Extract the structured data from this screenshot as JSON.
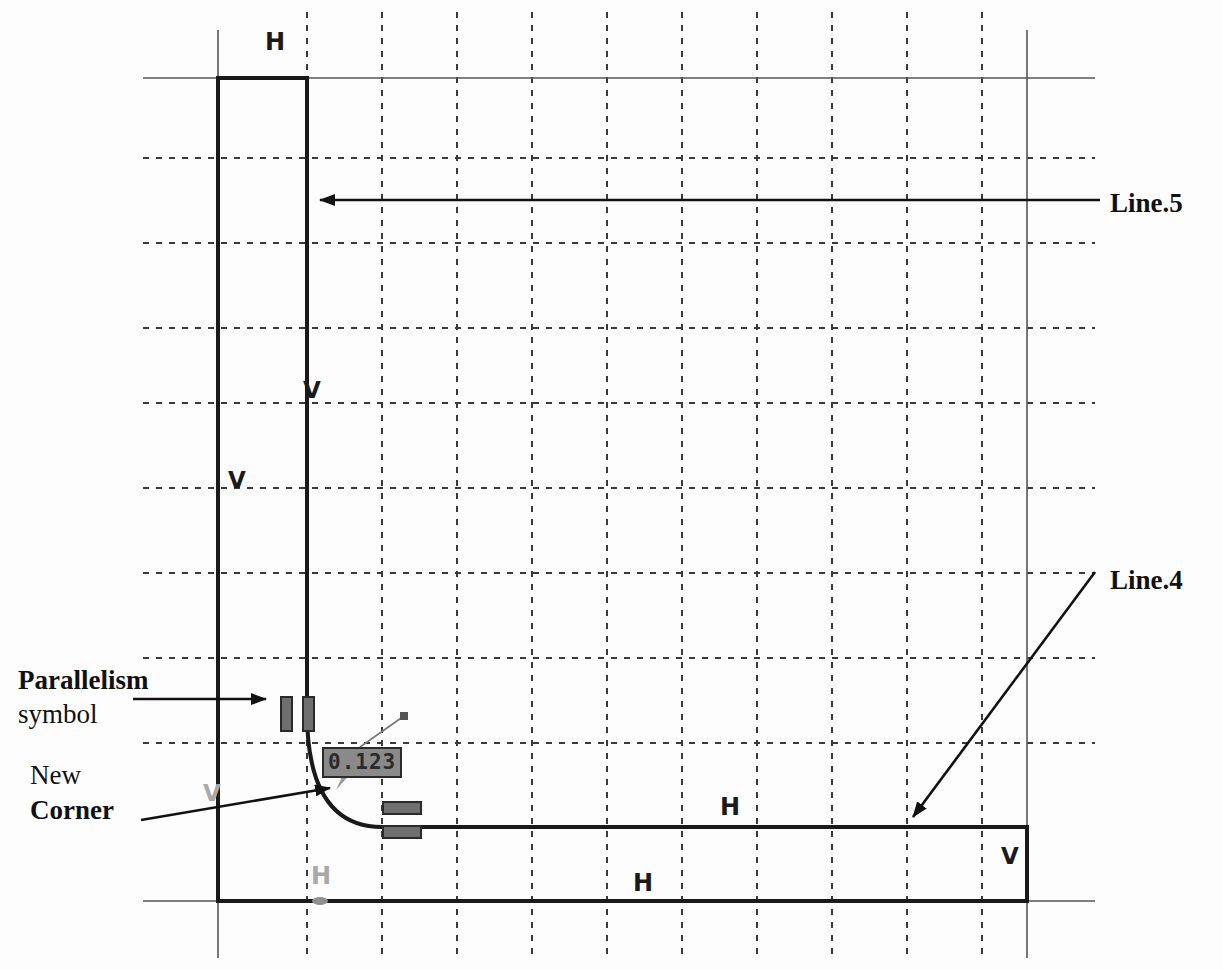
{
  "document": {
    "type": "cad-sketch",
    "title": "Parallelism constraint sketch"
  },
  "annotations": [
    {
      "id": "line5",
      "text": "Line.5",
      "weight": "bold",
      "x": 1110,
      "y": 188
    },
    {
      "id": "line4",
      "text": "Line.4",
      "weight": "bold",
      "x": 1110,
      "y": 565
    },
    {
      "id": "parallelism",
      "text": "Parallelism",
      "weight": "bold",
      "x": 18,
      "y": 665
    },
    {
      "id": "symbol",
      "text": "symbol",
      "weight": "normal",
      "x": 18,
      "y": 697
    },
    {
      "id": "new",
      "text": "New",
      "weight": "normal",
      "x": 30,
      "y": 760
    },
    {
      "id": "corner",
      "text": "Corner",
      "weight": "bold",
      "x": 30,
      "y": 793
    }
  ],
  "dimension": {
    "value": "0.123",
    "x": 322,
    "y": 747,
    "box_color": "#8a8a8a",
    "text_color": "#2b2b2b"
  },
  "constraints": [
    {
      "id": "h-top",
      "glyph": "H",
      "kind": "horizontal",
      "x": 265,
      "y": 28,
      "state": "active"
    },
    {
      "id": "v-inner",
      "glyph": "V",
      "kind": "vertical",
      "x": 303,
      "y": 377,
      "state": "active"
    },
    {
      "id": "v-outer",
      "glyph": "V",
      "kind": "vertical",
      "x": 228,
      "y": 467,
      "state": "active"
    },
    {
      "id": "h-mid-right",
      "glyph": "H",
      "kind": "horizontal",
      "x": 720,
      "y": 793,
      "state": "active"
    },
    {
      "id": "v-right-edge",
      "glyph": "V",
      "kind": "vertical",
      "x": 1001,
      "y": 843,
      "state": "active"
    },
    {
      "id": "h-bottom",
      "glyph": "H",
      "kind": "horizontal",
      "x": 633,
      "y": 869,
      "state": "active"
    },
    {
      "id": "h-faded",
      "glyph": "H",
      "kind": "horizontal",
      "x": 311,
      "y": 862,
      "state": "faded"
    },
    {
      "id": "v-faded",
      "glyph": "V",
      "kind": "vertical",
      "x": 203,
      "y": 780,
      "state": "faded"
    }
  ],
  "parallelism_symbols": [
    {
      "id": "para-vertical",
      "orientation": "vertical",
      "x": 281,
      "y": 697
    },
    {
      "id": "para-horizontal",
      "orientation": "horizontal",
      "x": 383,
      "y": 802
    }
  ],
  "grid": {
    "vertical_dashed": [
      307,
      382,
      457,
      532,
      607,
      682,
      757,
      832,
      907,
      982
    ],
    "horizontal_dashed": [
      158,
      243,
      328,
      403,
      488,
      573,
      658,
      743
    ],
    "axis_vertical": [
      218,
      1027
    ],
    "axis_horizontal": [
      78,
      901
    ],
    "color": "#3a3a3a",
    "dash": "6 7"
  },
  "profile": {
    "description": "L-shaped closed contour with filleted inner corner",
    "outer_left_x": 218,
    "inner_left_x": 307,
    "top_y": 78,
    "mid_y": 827,
    "bottom_y": 901,
    "right_x": 1027,
    "fillet_radius": 75,
    "color": "#1a1a1a",
    "stroke_width": 4
  },
  "leaders": [
    {
      "id": "leader-line5",
      "from_x": 1100,
      "from_y": 200,
      "to_x": 312,
      "to_y": 200,
      "arrow": "end"
    },
    {
      "id": "leader-line4",
      "from_x": 1095,
      "from_y": 572,
      "to_x": 908,
      "to_y": 822,
      "arrow": "end"
    },
    {
      "id": "leader-symbol",
      "from_x": 133,
      "from_y": 699,
      "to_x": 272,
      "to_y": 699,
      "arrow": "end"
    },
    {
      "id": "leader-corner",
      "from_x": 141,
      "from_y": 820,
      "to_x": 335,
      "to_y": 787,
      "arrow": "end"
    },
    {
      "id": "leader-dim",
      "from_x": 404,
      "from_y": 716,
      "to_x": 358,
      "to_y": 748,
      "arrow": "none"
    }
  ]
}
